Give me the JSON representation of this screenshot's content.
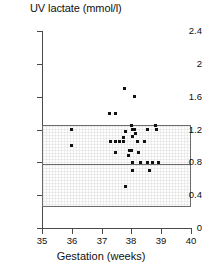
{
  "chart_data": {
    "type": "scatter",
    "title": "UV lactate (mmol/l)",
    "xlabel": "Gestation (weeks)",
    "ylabel": "UV lactate (mmol/l)",
    "xlim": [
      35,
      40
    ],
    "ylim": [
      0,
      2.4
    ],
    "xticks": [
      35,
      36,
      37,
      38,
      39,
      40
    ],
    "yticks": [
      0,
      0.4,
      0.8,
      1.2,
      1.6,
      2,
      2.4
    ],
    "xtick_labels": [
      "35",
      "36",
      "37",
      "38",
      "39",
      "40"
    ],
    "ytick_labels": [
      "0",
      "0.4",
      "0.8",
      "1.2",
      "1.6",
      "2",
      "2.4"
    ],
    "grid": false,
    "legend": null,
    "marker": "square",
    "marker_color": "#111111",
    "reference_band": {
      "label": "reference range box",
      "x_start": 35,
      "x_end": 40,
      "y_lower": 0.25,
      "y_upper": 1.25,
      "median_line_y": 0.78,
      "fill": "#fdfdfd",
      "border_color": "#6b6b6b"
    },
    "points": [
      {
        "x": 36.0,
        "y": 1.2
      },
      {
        "x": 36.0,
        "y": 1.0
      },
      {
        "x": 37.25,
        "y": 1.4
      },
      {
        "x": 37.45,
        "y": 1.4
      },
      {
        "x": 37.3,
        "y": 1.05
      },
      {
        "x": 37.45,
        "y": 1.05
      },
      {
        "x": 37.6,
        "y": 1.05
      },
      {
        "x": 37.72,
        "y": 1.05
      },
      {
        "x": 37.45,
        "y": 0.92
      },
      {
        "x": 37.72,
        "y": 1.1
      },
      {
        "x": 37.78,
        "y": 1.7
      },
      {
        "x": 37.8,
        "y": 0.5
      },
      {
        "x": 37.8,
        "y": 1.18
      },
      {
        "x": 37.9,
        "y": 0.88
      },
      {
        "x": 37.95,
        "y": 0.95
      },
      {
        "x": 38.0,
        "y": 0.95
      },
      {
        "x": 38.0,
        "y": 1.25
      },
      {
        "x": 38.05,
        "y": 1.2
      },
      {
        "x": 38.05,
        "y": 1.12
      },
      {
        "x": 38.12,
        "y": 1.2
      },
      {
        "x": 38.05,
        "y": 0.8
      },
      {
        "x": 38.05,
        "y": 0.7
      },
      {
        "x": 38.1,
        "y": 1.6
      },
      {
        "x": 38.15,
        "y": 1.15
      },
      {
        "x": 38.2,
        "y": 1.05
      },
      {
        "x": 38.25,
        "y": 0.92
      },
      {
        "x": 38.3,
        "y": 0.8
      },
      {
        "x": 38.45,
        "y": 1.05
      },
      {
        "x": 38.55,
        "y": 1.2
      },
      {
        "x": 38.55,
        "y": 0.8
      },
      {
        "x": 38.62,
        "y": 0.7
      },
      {
        "x": 38.7,
        "y": 0.8
      },
      {
        "x": 38.8,
        "y": 1.25
      },
      {
        "x": 38.85,
        "y": 1.2
      },
      {
        "x": 38.9,
        "y": 0.8
      }
    ]
  }
}
